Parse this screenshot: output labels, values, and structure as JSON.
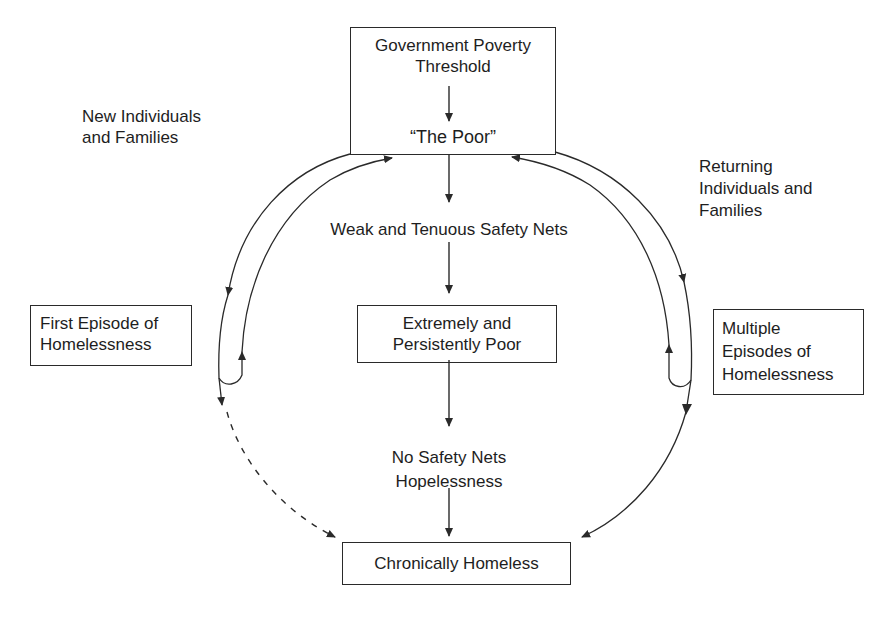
{
  "diagram": {
    "nodes": {
      "poverty_threshold": {
        "label_line1": "Government Poverty",
        "label_line2": "Threshold",
        "sub_label": "“The Poor”"
      },
      "new_entrants": {
        "label_line1": "New Individuals",
        "label_line2": "and Families"
      },
      "returning_entrants": {
        "label_line1": "Returning",
        "label_line2": "Individuals and",
        "label_line3": "Families"
      },
      "weak_safety_nets": {
        "label": "Weak and Tenuous Safety Nets"
      },
      "first_episode": {
        "label_line1": "First Episode of",
        "label_line2": "Homelessness"
      },
      "extremely_poor": {
        "label_line1": "Extremely and",
        "label_line2": "Persistently Poor"
      },
      "multiple_episodes": {
        "label_line1": "Multiple",
        "label_line2": "Episodes of",
        "label_line3": "Homelessness"
      },
      "no_safety_nets": {
        "label_line1": "No Safety Nets",
        "label_line2": "Hopelessness"
      },
      "chronically_homeless": {
        "label": "Chronically Homeless"
      }
    },
    "edges": [
      {
        "from": "Government Poverty Threshold",
        "to": "The Poor",
        "style": "solid"
      },
      {
        "from": "The Poor",
        "to": "Weak and Tenuous Safety Nets",
        "style": "solid"
      },
      {
        "from": "Weak and Tenuous Safety Nets",
        "to": "Extremely and Persistently Poor",
        "style": "solid"
      },
      {
        "from": "Extremely and Persistently Poor",
        "to": "No Safety Nets Hopelessness",
        "style": "solid"
      },
      {
        "from": "No Safety Nets Hopelessness",
        "to": "Chronically Homeless",
        "style": "solid"
      },
      {
        "from": "The Poor",
        "to": "First Episode of Homelessness",
        "style": "solid curved"
      },
      {
        "from": "First Episode of Homelessness",
        "to": "The Poor",
        "style": "solid curved"
      },
      {
        "from": "First Episode of Homelessness",
        "to": "Chronically Homeless",
        "style": "dashed curved"
      },
      {
        "from": "The Poor",
        "to": "Multiple Episodes of Homelessness",
        "style": "solid curved"
      },
      {
        "from": "Multiple Episodes of Homelessness",
        "to": "The Poor",
        "style": "solid curved"
      },
      {
        "from": "Multiple Episodes of Homelessness",
        "to": "Chronically Homeless",
        "style": "solid curved"
      }
    ],
    "colors": {
      "line": "#2a2a2a",
      "text": "#1e1e1e",
      "background": "#ffffff"
    }
  }
}
